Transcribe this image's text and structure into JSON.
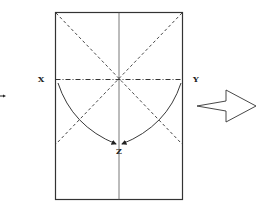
{
  "diagram": {
    "type": "folding-instruction",
    "labels": {
      "x": "X",
      "y": "Y",
      "z": "Z"
    },
    "colors": {
      "line": "#333333",
      "background": "#ffffff"
    },
    "elements": {
      "paper": "rectangle-sheet",
      "center_crease": "vertical valley line",
      "horizontal_crease": "dash-dot mountain fold line through center",
      "diagonal_creases": "two dashed diagonals crossing at center",
      "fold_arrows": "curved arrows from X and Y meeting at Z",
      "next_step_arrow": "hollow right-pointing arrow"
    }
  }
}
